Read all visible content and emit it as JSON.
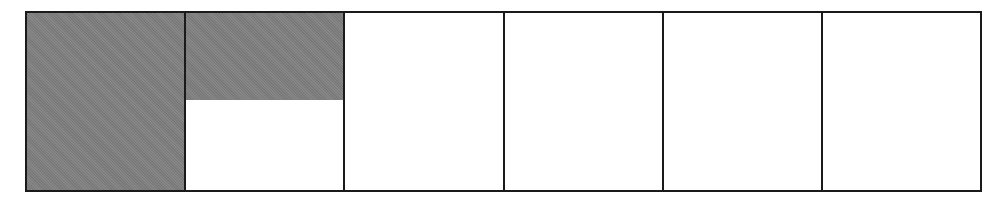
{
  "diagram": {
    "type": "fraction-strip",
    "shade_color": "#808080",
    "border_color": "#1a1a1a",
    "cells": [
      {
        "index": 1,
        "shaded_fraction": 1.0
      },
      {
        "index": 2,
        "shaded_fraction": 0.49
      },
      {
        "index": 3,
        "shaded_fraction": 0
      },
      {
        "index": 4,
        "shaded_fraction": 0
      },
      {
        "index": 5,
        "shaded_fraction": 0
      },
      {
        "index": 6,
        "shaded_fraction": 0
      }
    ]
  }
}
